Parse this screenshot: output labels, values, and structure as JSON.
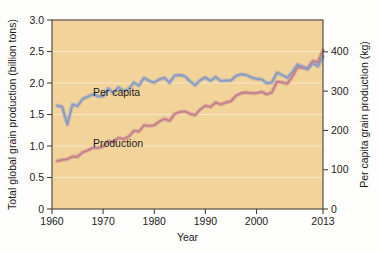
{
  "figure": {
    "background_color": "#fdfdfb",
    "plot_background_color": "#f2d49b",
    "axis_color": "#4a4038",
    "gridline_color": "#f7ecd2"
  },
  "labels": {
    "left_axis_title": "Total global grain production (billion tons)",
    "right_axis_title": "Per capita grain production (kg)",
    "x_axis_title": "Year",
    "series_production_label": "Production",
    "series_per_capita_label": "Per capita"
  },
  "chart_data": {
    "type": "line",
    "title": "",
    "subtitle": "",
    "xlabel": "Year",
    "ylabel": "Total global grain production (billion tons)",
    "y2label": "Per capita grain production (kg)",
    "xlim": [
      1960,
      2013
    ],
    "ylim": [
      0,
      3.0
    ],
    "y2lim": [
      0,
      481
    ],
    "grid": true,
    "legend_position": "inline-annotations",
    "x_ticks": [
      1960,
      1970,
      1980,
      1990,
      2000,
      2013
    ],
    "x_tick_labels": [
      "1960",
      "1970",
      "1980",
      "1990",
      "2000",
      "2013"
    ],
    "y_ticks": [
      0,
      0.5,
      1.0,
      1.5,
      2.0,
      2.5,
      3.0
    ],
    "y_tick_labels": [
      "0",
      "0.5",
      "1.0",
      "1.5",
      "2.0",
      "2.5",
      "3.0"
    ],
    "y2_ticks": [
      0,
      100,
      200,
      300,
      400
    ],
    "y2_tick_labels": [
      "0",
      "100",
      "200",
      "300",
      "400"
    ],
    "colors": {
      "production": "#c4818c",
      "per_capita": "#8a9bc4"
    },
    "x": [
      1961,
      1962,
      1963,
      1964,
      1965,
      1966,
      1967,
      1968,
      1969,
      1970,
      1971,
      1972,
      1973,
      1974,
      1975,
      1976,
      1977,
      1978,
      1979,
      1980,
      1981,
      1982,
      1983,
      1984,
      1985,
      1986,
      1987,
      1988,
      1989,
      1990,
      1991,
      1992,
      1993,
      1994,
      1995,
      1996,
      1997,
      1998,
      1999,
      2000,
      2001,
      2002,
      2003,
      2004,
      2005,
      2006,
      2007,
      2008,
      2009,
      2010,
      2011,
      2012,
      2013
    ],
    "series": [
      {
        "name": "Production",
        "unit": "billion tons",
        "axis": "left",
        "color": "#c4818c",
        "values": [
          0.76,
          0.78,
          0.79,
          0.83,
          0.83,
          0.9,
          0.93,
          0.97,
          0.97,
          0.99,
          1.08,
          1.06,
          1.13,
          1.11,
          1.15,
          1.24,
          1.23,
          1.33,
          1.32,
          1.33,
          1.39,
          1.43,
          1.4,
          1.51,
          1.54,
          1.55,
          1.51,
          1.49,
          1.58,
          1.64,
          1.62,
          1.69,
          1.66,
          1.69,
          1.71,
          1.8,
          1.84,
          1.85,
          1.84,
          1.84,
          1.86,
          1.82,
          1.85,
          2.02,
          2.01,
          1.99,
          2.1,
          2.25,
          2.24,
          2.23,
          2.35,
          2.33,
          2.52
        ]
      },
      {
        "name": "Per capita",
        "unit": "kg",
        "axis": "right",
        "color": "#8a9bc4",
        "values": [
          263,
          260,
          215,
          266,
          262,
          280,
          286,
          292,
          287,
          287,
          307,
          295,
          310,
          300,
          305,
          322,
          314,
          334,
          326,
          322,
          330,
          334,
          321,
          340,
          341,
          338,
          325,
          315,
          328,
          335,
          326,
          336,
          326,
          327,
          327,
          339,
          343,
          341,
          335,
          331,
          330,
          320,
          322,
          347,
          341,
          334,
          348,
          368,
          362,
          356,
          371,
          363,
          388
        ]
      }
    ]
  },
  "annotations": [
    {
      "text": "Per capita",
      "x_data": 1968.0,
      "y_left_equiv": 1.8
    },
    {
      "text": "Production",
      "x_data": 1968.0,
      "y_left_equiv": 0.98
    }
  ]
}
